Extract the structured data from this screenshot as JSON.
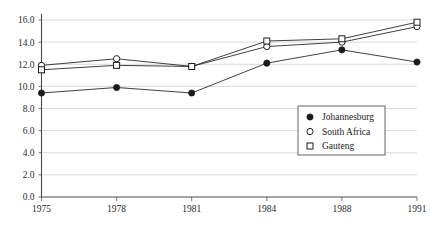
{
  "chart_data": {
    "type": "line",
    "title": "",
    "subtitle": "",
    "xlabel": "",
    "ylabel": "",
    "x": [
      "1975",
      "1978",
      "1981",
      "1984",
      "1988",
      "1991"
    ],
    "categories": [
      "1975",
      "1978",
      "1981",
      "1984",
      "1988",
      "1991"
    ],
    "series": [
      {
        "name": "Johannesburg",
        "marker": "filled-circle",
        "values": [
          9.4,
          9.9,
          9.4,
          12.1,
          13.3,
          12.2
        ]
      },
      {
        "name": "South Africa",
        "marker": "open-circle",
        "values": [
          11.9,
          12.5,
          11.8,
          13.6,
          14.0,
          15.4
        ]
      },
      {
        "name": "Gauteng",
        "marker": "open-square",
        "values": [
          11.5,
          11.9,
          11.8,
          14.1,
          14.3,
          15.8
        ]
      }
    ],
    "ylim": [
      0.0,
      16.0
    ],
    "yticks": [
      "0.0",
      "2.0",
      "4.0",
      "6.0",
      "8.0",
      "10.0",
      "12.0",
      "14.0",
      "16.0"
    ],
    "ytick_values": [
      0.0,
      2.0,
      4.0,
      6.0,
      8.0,
      10.0,
      12.0,
      14.0,
      16.0
    ],
    "xticks": [
      "1975",
      "1978",
      "1981",
      "1984",
      "1988",
      "1991"
    ],
    "grid": "horizontal",
    "legend_position": "lower-right",
    "legend_entries": [
      "Johannesburg",
      "South Africa",
      "Gauteng"
    ],
    "colors": {
      "line": "#2a2a2a",
      "grid": "#c8c8c8",
      "axis": "#4a4a4a",
      "text": "#1a1a1a",
      "background": "#ffffff"
    }
  }
}
